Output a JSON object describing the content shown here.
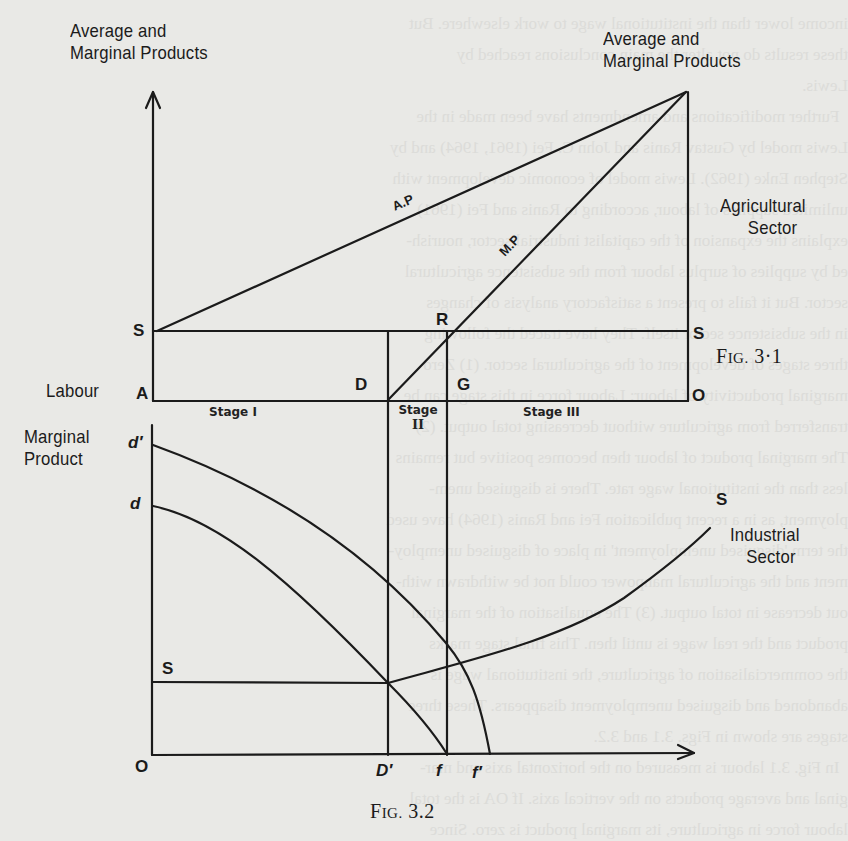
{
  "figure_top": {
    "caption_prefix": "F",
    "caption_smallcaps": "IG.",
    "caption_number": "3·1",
    "y_axis_label_left_line1": "Average and",
    "y_axis_label_left_line2": "Marginal Products",
    "y_axis_label_right_line1": "Average and",
    "y_axis_label_right_line2": "Marginal Products",
    "sector_label_line1": "Agricultural",
    "sector_label_line2": "Sector",
    "x_axis_label": "Labour",
    "curves": {
      "average_product": "A.P",
      "marginal_product": "M.P"
    },
    "points": {
      "S_left": "S",
      "S_right": "S",
      "A": "A",
      "D": "D",
      "G": "G",
      "R": "R",
      "O": "O"
    },
    "stages": {
      "stage_1": "Stage I",
      "stage_2_line1": "Stage",
      "stage_2_line2": "II",
      "stage_3": "Stage III"
    }
  },
  "figure_bottom": {
    "caption_prefix": "F",
    "caption_smallcaps": "IG.",
    "caption_number": "3.2",
    "y_axis_label_line1": "Marginal",
    "y_axis_label_line2": "Product",
    "sector_label_line1": "Industrial",
    "sector_label_line2": "Sector",
    "points": {
      "d_prime": "d′",
      "d": "d",
      "S_left": "S",
      "S_curve_end": "S",
      "O": "O",
      "D_prime": "D′",
      "f": "f",
      "f_prime": "f′"
    }
  },
  "background_bleed_text": [
    "income lower than the institutional wage to work elsewhere. But",
    "these results do not alter the main conclusions reached by",
    "Lewis.",
    "  Further modifications and amendments have been made in the",
    "Lewis model by Gustav Ranis and John C. Fei (1961, 1964) and by",
    "Stephen Enke (1962). Lewis model of economic development with",
    "unlimited supplies of labour, according to Ranis and Fei (1961)",
    "explains the expansion of the capitalist industrial sector, nourish-",
    "ed by supplies of surplus labour from the subsistence agricultural",
    "sector. But it fails to present a satisfactory analysis of changes",
    "in the subsistence sector itself. They have traced the following",
    "three stages of development of the agricultural sector. (1) Zero",
    "marginal productivity of labour: Labour force in this stage can be",
    "transferred from agriculture without decreasing total output. (2)",
    "The marginal product of labour then becomes positive but remains",
    "less than the institutional wage rate. There is disguised unem-",
    "ployment, as in a recent publication Fei and Ranis (1964) have used",
    "the term 'disguised unemployment' in place of disguised unemploy-",
    "ment and the agricultural manpower could not be withdrawn with-",
    "out decrease in total output. (3) The equalisation of the marginal",
    "product and the real wage is until then. This final stage marks",
    "the commercialisation of agriculture, the institutional wage is",
    "abandoned and disguised unemployment disappears. These three",
    "stages are shown in Figs. 3.1 and 3.2.",
    "  In Fig. 3.1 labour is measured on the horizontal axis and mar-",
    "ginal and average products on the vertical axis. If OA is the total",
    "labour force in agriculture, its marginal product is zero. Since"
  ],
  "colors": {
    "paper": "#e9e9e6",
    "ink": "#1b1b1b",
    "bleed": "#d2d2cf"
  }
}
